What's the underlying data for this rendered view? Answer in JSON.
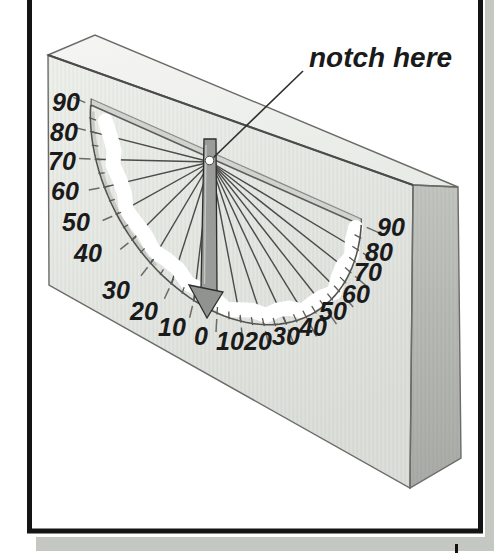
{
  "figure": {
    "annotation": "notch here",
    "scale": {
      "unit": "degrees",
      "labels": [
        "90",
        "80",
        "70",
        "60",
        "50",
        "40",
        "30",
        "20",
        "10",
        "0",
        "10",
        "20",
        "30",
        "40",
        "50",
        "60",
        "70",
        "80",
        "90"
      ]
    },
    "colors": {
      "shadow": "#c5c7c2",
      "frame_border": "#141414",
      "board_front_light": "#eef0ec",
      "board_front_dark": "#dcdeda",
      "board_top_light": "#f5f6f3",
      "board_top_dark": "#e9ebe7",
      "board_side_light": "#c2c4c0",
      "board_side_dark": "#a9aba7",
      "slot_bevel": "#d2d3cf",
      "edge_line": "#6b6b69",
      "fan_line": "#4b4b49",
      "arrow_fill": "#9a9c99",
      "arrow_outline": "#2e2e2e",
      "chalk_band": "#ffffff",
      "ink": "#1a1a1a"
    }
  }
}
